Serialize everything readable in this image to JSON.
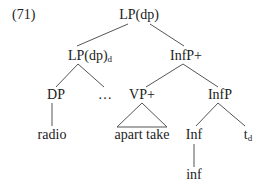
{
  "example": {
    "number": "(71)"
  },
  "tree": {
    "root": {
      "label": "LP(dp)"
    },
    "lp_dp_d": {
      "label": "LP(dp)",
      "subscript": "d"
    },
    "infp_plus": {
      "label": "InfP+"
    },
    "dp": {
      "label": "DP"
    },
    "ellipsis": {
      "label": "…"
    },
    "vp_plus": {
      "label": "VP+"
    },
    "infp": {
      "label": "InfP"
    },
    "radio": {
      "label": "radio"
    },
    "apart_take": {
      "label": "apart take"
    },
    "inf_head": {
      "label": "Inf"
    },
    "trace": {
      "label": "t",
      "subscript": "d"
    },
    "inf_word": {
      "label": "inf"
    }
  }
}
